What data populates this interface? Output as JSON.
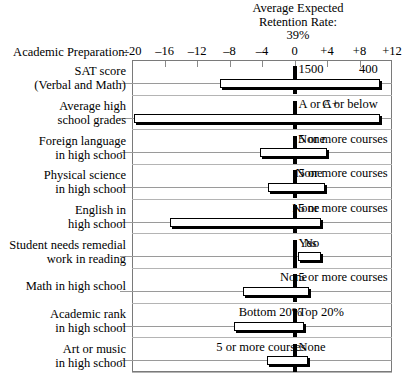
{
  "header": {
    "line1": "Average Expected",
    "line2": "Retention Rate:",
    "line3": "39%"
  },
  "axis_caption": "Academic Preparation:",
  "chart_data": {
    "type": "bar",
    "subtype": "diverging-range-bars",
    "title": "Average Expected Retention Rate: 39%",
    "xlabel": "Academic Preparation:",
    "ylabel": "",
    "xlim": [
      -20,
      12
    ],
    "xticks": [
      -20,
      -16,
      -12,
      -8,
      -4,
      0,
      4,
      8,
      12
    ],
    "xticklabels": [
      "-20",
      "-16",
      "-12",
      "-8",
      "-4",
      "0",
      "+4",
      "+8",
      "+12"
    ],
    "grid": false,
    "legend": null,
    "reference_line": 0,
    "categories": [
      "SAT score (Verbal and Math)",
      "Average high school grades",
      "Foreign language in high school",
      "Physical science in high school",
      "English in high school",
      "Student needs remedial work in reading",
      "Math in high school",
      "Academic rank in high school",
      "Art or music in high school"
    ],
    "bars": [
      {
        "label_lines": [
          "SAT score",
          "(Verbal and Math)"
        ],
        "low": -9.2,
        "high": 10.5,
        "low_label": "400",
        "high_label": "1500"
      },
      {
        "label_lines": [
          "Average high",
          "school grades"
        ],
        "low": -19.8,
        "high": 10.5,
        "low_label": "C or below",
        "high_label": "A or A+"
      },
      {
        "label_lines": [
          "Foreign language",
          "in high school"
        ],
        "low": -4.3,
        "high": 4.0,
        "low_label": "None",
        "high_label": "5 or more courses"
      },
      {
        "label_lines": [
          "Physical science",
          "in high school"
        ],
        "low": -3.3,
        "high": 3.7,
        "low_label": "None",
        "high_label": "5 or more courses"
      },
      {
        "label_lines": [
          "English in",
          "high school"
        ],
        "low": -15.3,
        "high": 3.3,
        "low_label": "None",
        "high_label": "5 or more courses"
      },
      {
        "label_lines": [
          "Student needs remedial",
          "work in reading"
        ],
        "low": 0.4,
        "high": 3.3,
        "low_label": "No",
        "high_label": "Yes"
      },
      {
        "label_lines": [
          "Math in high school"
        ],
        "low": -6.4,
        "high": 1.8,
        "low_label": "None",
        "high_label": "5 or more courses"
      },
      {
        "label_lines": [
          "Academic rank",
          "in high school"
        ],
        "low": -7.4,
        "high": 1.2,
        "low_label": "Bottom 20%",
        "high_label": "Top 20%"
      },
      {
        "label_lines": [
          "Art or music",
          "in high school"
        ],
        "low": -3.4,
        "high": 1.6,
        "low_label": "5 or more courses",
        "high_label": "None"
      }
    ]
  }
}
